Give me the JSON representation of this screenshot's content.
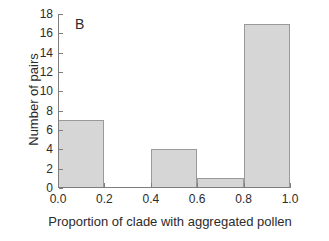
{
  "chart_data": {
    "type": "bar",
    "title": "",
    "panel_label": "B",
    "xlabel": "Proportion of clade with aggregated pollen",
    "ylabel": "Number of pairs",
    "categories": [
      "0.0-0.2",
      "0.2-0.4",
      "0.4-0.6",
      "0.6-0.8",
      "0.8-1.0"
    ],
    "bin_edges": [
      0.0,
      0.2,
      0.4,
      0.6,
      0.8,
      1.0
    ],
    "values": [
      7,
      0,
      4,
      1,
      17
    ],
    "xlim": [
      0.0,
      1.0
    ],
    "ylim": [
      0,
      18
    ],
    "xticks": [
      "0.0",
      "0.2",
      "0.4",
      "0.6",
      "0.8",
      "1.0"
    ],
    "xtick_values": [
      0.0,
      0.2,
      0.4,
      0.6,
      0.8,
      1.0
    ],
    "yticks": [
      "0",
      "2",
      "4",
      "6",
      "8",
      "10",
      "12",
      "14",
      "16",
      "18"
    ],
    "ytick_values": [
      0,
      2,
      4,
      6,
      8,
      10,
      12,
      14,
      16,
      18
    ],
    "grid": false,
    "legend": null,
    "bar_fill_color": "#d6d6d6",
    "bar_edge_color": "#9a9a9a",
    "axis_color": "#7d7d7d",
    "text_color": "#2b2b2b",
    "background_color": "#ffffff"
  }
}
